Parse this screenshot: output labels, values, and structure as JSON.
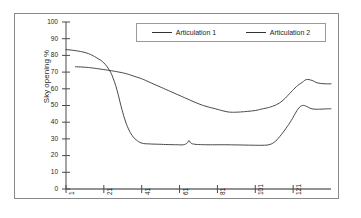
{
  "figure": {
    "y_axis_title": "Sky opening %"
  },
  "legend": {
    "position": "top-center",
    "entries": [
      {
        "label": "Articulation 1",
        "color": "#333333"
      },
      {
        "label": "Articulation 2",
        "color": "#333333"
      }
    ]
  },
  "axes": {
    "y_ticks": [
      "0",
      "10",
      "20",
      "30",
      "40",
      "50",
      "60",
      "70",
      "80",
      "90",
      "100"
    ],
    "x_ticks": [
      "1",
      "21",
      "41",
      "61",
      "81",
      "101",
      "121"
    ]
  },
  "chart_data": {
    "type": "line",
    "title": "",
    "xlabel": "",
    "ylabel": "Sky opening %",
    "xlim": [
      1,
      141
    ],
    "ylim": [
      0,
      100
    ],
    "grid": false,
    "legend_position": "top-center",
    "x_ticks": [
      1,
      21,
      41,
      61,
      81,
      101,
      121
    ],
    "y_ticks": [
      0,
      10,
      20,
      30,
      40,
      50,
      60,
      70,
      80,
      90,
      100
    ],
    "series": [
      {
        "name": "Articulation 1",
        "color": "#333333",
        "x": [
          1,
          5,
          10,
          14,
          18,
          21,
          24,
          26,
          28,
          30,
          32,
          34,
          36,
          38,
          41,
          45,
          50,
          55,
          60,
          63,
          65,
          66,
          67,
          69,
          72,
          76,
          81,
          86,
          91,
          96,
          101,
          105,
          108,
          111,
          114,
          117,
          120,
          122,
          124,
          126,
          128,
          131,
          135,
          139,
          141
        ],
        "y": [
          83.5,
          83,
          82,
          80.5,
          78,
          75.5,
          71,
          66,
          59,
          50,
          42,
          36,
          32,
          29.5,
          27.5,
          27,
          26.8,
          26.6,
          26.5,
          26.5,
          27.5,
          29,
          27.5,
          26.8,
          26.6,
          26.5,
          26.5,
          26.5,
          26.4,
          26.3,
          26.2,
          26.2,
          26.5,
          28,
          31.5,
          36,
          41,
          45,
          48.5,
          50,
          49.5,
          48,
          47.8,
          48,
          48
        ]
      },
      {
        "name": "Articulation 2",
        "color": "#333333",
        "x": [
          6,
          10,
          14,
          18,
          21,
          25,
          29,
          33,
          37,
          41,
          45,
          50,
          55,
          60,
          65,
          70,
          75,
          80,
          85,
          88,
          91,
          94,
          97,
          101,
          104,
          107,
          110,
          113,
          116,
          119,
          122,
          124,
          126,
          128,
          131,
          134,
          138,
          141
        ],
        "y": [
          73.2,
          73,
          72.6,
          72,
          71.5,
          70.8,
          70,
          69,
          67.5,
          66,
          64,
          61.5,
          59,
          56.5,
          54,
          51.5,
          49.5,
          48,
          46.5,
          46,
          46,
          46.2,
          46.5,
          47,
          47.8,
          48.5,
          49.5,
          51,
          53.5,
          57,
          60.5,
          62.5,
          64,
          65.5,
          65,
          63.5,
          63,
          63
        ]
      }
    ]
  }
}
